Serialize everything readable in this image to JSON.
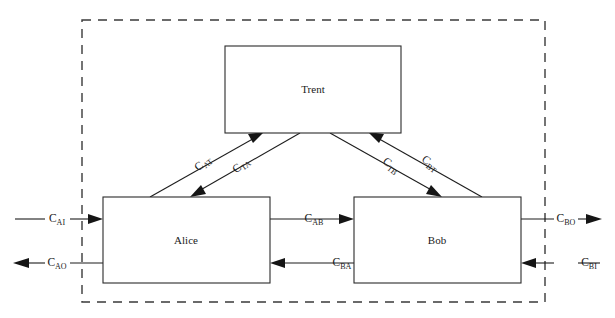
{
  "diagram": {
    "boundary": {
      "name": "security-boundary",
      "style": "dashed",
      "color": "#3a3a3a",
      "x": 82,
      "y": 20,
      "width": 463,
      "height": 282
    },
    "nodes": [
      {
        "id": "trent",
        "label": "Trent",
        "x": 225,
        "y": 46,
        "width": 176,
        "height": 87
      },
      {
        "id": "alice",
        "label": "Alice",
        "x": 103,
        "y": 197,
        "width": 167,
        "height": 86
      },
      {
        "id": "bob",
        "label": "Bob",
        "x": 354,
        "y": 197,
        "width": 167,
        "height": 86
      }
    ],
    "channels": [
      {
        "id": "c-at",
        "base": "C",
        "sub": "AT",
        "from": "alice",
        "to": "trent",
        "label_x": 205,
        "label_y": 166,
        "rotate": -38
      },
      {
        "id": "c-ta",
        "base": "C",
        "sub": "TA",
        "from": "trent",
        "to": "alice",
        "label_x": 243,
        "label_y": 168,
        "rotate": -38
      },
      {
        "id": "c-tb",
        "base": "C",
        "sub": "TB",
        "from": "trent",
        "to": "bob",
        "label_x": 389,
        "label_y": 168,
        "rotate": 38
      },
      {
        "id": "c-bt",
        "base": "C",
        "sub": "BT",
        "from": "bob",
        "to": "trent",
        "label_x": 428,
        "label_y": 166,
        "rotate": 38
      },
      {
        "id": "c-ab",
        "base": "C",
        "sub": "AB",
        "from": "alice",
        "to": "bob",
        "label_x": 314,
        "label_y": 219,
        "rotate": 0
      },
      {
        "id": "c-ba",
        "base": "C",
        "sub": "BA",
        "from": "bob",
        "to": "alice",
        "label_x": 342,
        "label_y": 263,
        "rotate": 0
      },
      {
        "id": "c-ai",
        "base": "C",
        "sub": "AI",
        "from": "external",
        "to": "alice",
        "label_x": 57,
        "label_y": 219,
        "rotate": 0
      },
      {
        "id": "c-ao",
        "base": "C",
        "sub": "AO",
        "from": "alice",
        "to": "external",
        "label_x": 57,
        "label_y": 263,
        "rotate": 0
      },
      {
        "id": "c-bo",
        "base": "C",
        "sub": "BO",
        "from": "bob",
        "to": "external",
        "label_x": 566,
        "label_y": 219,
        "rotate": 0
      },
      {
        "id": "c-bi",
        "base": "C",
        "sub": "BI",
        "from": "external",
        "to": "bob",
        "label_x": 589,
        "label_y": 263,
        "rotate": 0
      }
    ]
  }
}
